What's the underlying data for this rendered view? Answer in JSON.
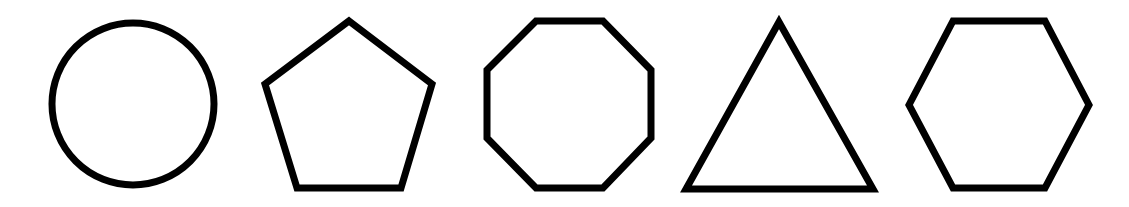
{
  "figure": {
    "background": "#ffffff",
    "stroke_color": "#000000",
    "stroke_width": 7,
    "shapes": [
      {
        "name": "circle",
        "sides": 0
      },
      {
        "name": "pentagon",
        "sides": 5
      },
      {
        "name": "octagon",
        "sides": 8
      },
      {
        "name": "triangle",
        "sides": 3
      },
      {
        "name": "hexagon",
        "sides": 6
      }
    ]
  }
}
